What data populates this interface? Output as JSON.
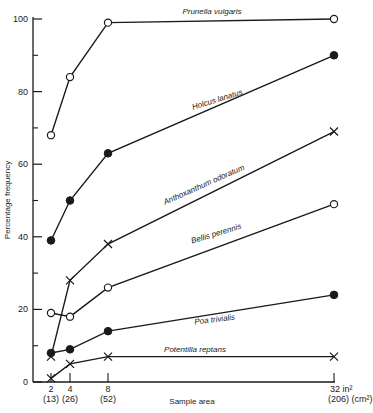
{
  "chart_data": {
    "type": "line",
    "title": "",
    "xlabel": "Sample area",
    "ylabel": "Percentage frequency",
    "ylim": [
      0,
      100
    ],
    "grid": false,
    "legend": "inline labels along lines",
    "x": [
      2,
      4,
      8,
      32
    ],
    "x_tick_labels": [
      "2",
      "4",
      "8",
      "32 in²"
    ],
    "x_tick_sublabels": [
      "(13)",
      "(26)",
      "(52)",
      "(206) (cm²)"
    ],
    "y_ticks": [
      0,
      20,
      40,
      60,
      80,
      100
    ],
    "y_minor_ticks": [
      10,
      30,
      50,
      70,
      90
    ],
    "series": [
      {
        "name": "Prunella vulgaris",
        "marker": "open-circle",
        "values": [
          68,
          84,
          99,
          100
        ]
      },
      {
        "name": "Holcus lanatus",
        "marker": "filled-circle",
        "values": [
          39,
          50,
          63,
          90
        ]
      },
      {
        "name": "Anthoxanthum odoratum",
        "marker": "cross",
        "values": [
          7,
          28,
          38,
          69
        ]
      },
      {
        "name": "Bellis perennis",
        "marker": "open-circle",
        "values": [
          19,
          18,
          26,
          49
        ]
      },
      {
        "name": "Poa trivialis",
        "marker": "filled-circle",
        "values": [
          8,
          9,
          14,
          24
        ]
      },
      {
        "name": "Potentilla reptans",
        "marker": "cross",
        "values": [
          1,
          5,
          7,
          7
        ]
      }
    ]
  },
  "colors": {
    "line": "#1a1a1a",
    "background": "#ffffff"
  }
}
